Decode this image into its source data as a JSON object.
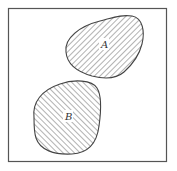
{
  "diagram": {
    "type": "venn",
    "universe": {
      "label": ""
    },
    "sets": [
      {
        "id": "A",
        "label": "A",
        "hatch": "forward-diagonal"
      },
      {
        "id": "B",
        "label": "B",
        "hatch": "backward-diagonal"
      }
    ],
    "relationship": "disjoint",
    "colors": {
      "line": "#444444",
      "hatch": "#555555",
      "background": "#ffffff"
    }
  }
}
